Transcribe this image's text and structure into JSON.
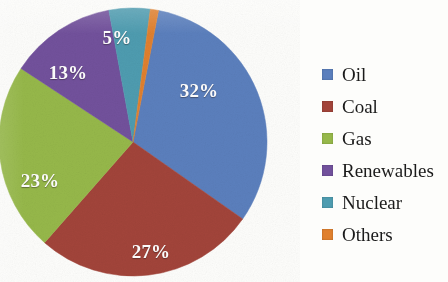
{
  "chart_data": {
    "type": "pie",
    "title": "",
    "subtitle": "",
    "xlabel": "",
    "ylabel": "",
    "legend_position": "right",
    "grid": false,
    "categories": [
      "Oil",
      "Coal",
      "Gas",
      "Renewables",
      "Nuclear",
      "Others"
    ],
    "values": [
      32,
      27,
      23,
      13,
      5,
      1
    ],
    "value_suffix": "%",
    "data_labels": [
      "32%",
      "27%",
      "23%",
      "13%",
      "5%",
      ""
    ],
    "colors": [
      "#5b7fbd",
      "#a2443a",
      "#96b84a",
      "#72519c",
      "#4e9cb0",
      "#e0802e"
    ],
    "label_text_color": "#ffffff",
    "start_angle_deg": 11,
    "direction": "clockwise",
    "slices": [
      {
        "name": "Oil",
        "value": 32,
        "label": "32%",
        "color": "#5b7fbd",
        "label_x": 199,
        "label_y": 91
      },
      {
        "name": "Coal",
        "value": 27,
        "label": "27%",
        "color": "#a2443a",
        "label_x": 151,
        "label_y": 252
      },
      {
        "name": "Gas",
        "value": 23,
        "label": "23%",
        "color": "#96b84a",
        "label_x": 40,
        "label_y": 181
      },
      {
        "name": "Renewables",
        "value": 13,
        "label": "13%",
        "color": "#72519c",
        "label_x": 68,
        "label_y": 73
      },
      {
        "name": "Nuclear",
        "value": 5,
        "label": "5%",
        "color": "#4e9cb0",
        "label_x": 117,
        "label_y": 38
      },
      {
        "name": "Others",
        "value": 1,
        "label": "",
        "color": "#e0802e",
        "label_x": 0,
        "label_y": 0
      }
    ]
  },
  "pie": {
    "center_x": 133,
    "center_y": 142,
    "radius": 134,
    "labels": {
      "oil": "32%",
      "coal": "27%",
      "gas": "23%",
      "renewables": "13%",
      "nuclear": "5%"
    }
  },
  "legend": {
    "items": [
      {
        "label": "Oil",
        "color": "#5b7fbd"
      },
      {
        "label": "Coal",
        "color": "#a2443a"
      },
      {
        "label": "Gas",
        "color": "#96b84a"
      },
      {
        "label": "Renewables",
        "color": "#72519c"
      },
      {
        "label": "Nuclear",
        "color": "#4e9cb0"
      },
      {
        "label": "Others",
        "color": "#e0802e"
      }
    ]
  }
}
